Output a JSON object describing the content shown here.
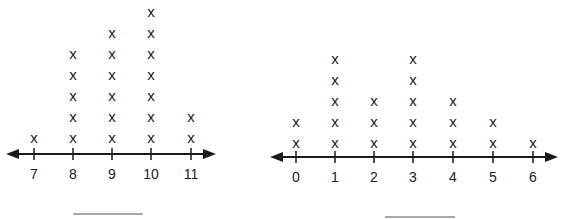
{
  "marker": "x",
  "chart_data": [
    {
      "type": "dot_plot",
      "title": "",
      "xlabel": "",
      "ylabel": "",
      "categories": [
        "7",
        "8",
        "9",
        "10",
        "11"
      ],
      "values": [
        1,
        5,
        6,
        7,
        2
      ],
      "answer_blank": ""
    },
    {
      "type": "dot_plot",
      "title": "",
      "xlabel": "",
      "ylabel": "",
      "categories": [
        "0",
        "1",
        "2",
        "3",
        "4",
        "5",
        "6"
      ],
      "values": [
        2,
        5,
        3,
        5,
        3,
        2,
        1
      ],
      "answer_blank": ""
    }
  ],
  "layout": [
    {
      "axis_y": 154,
      "x_start": 6,
      "x_end": 216,
      "ticks_x": [
        34,
        73,
        112,
        151,
        191
      ],
      "label_y": 179,
      "mark_base_y": 143,
      "mark_step": 21,
      "blank": {
        "x1": 73,
        "x2": 143,
        "y": 214
      }
    },
    {
      "axis_y": 157,
      "x_start": 270,
      "x_end": 558,
      "ticks_x": [
        296,
        335,
        374,
        413,
        453,
        493,
        533
      ],
      "label_y": 182,
      "mark_base_y": 148,
      "mark_step": 21,
      "blank": {
        "x1": 385,
        "x2": 455,
        "y": 217
      }
    }
  ]
}
